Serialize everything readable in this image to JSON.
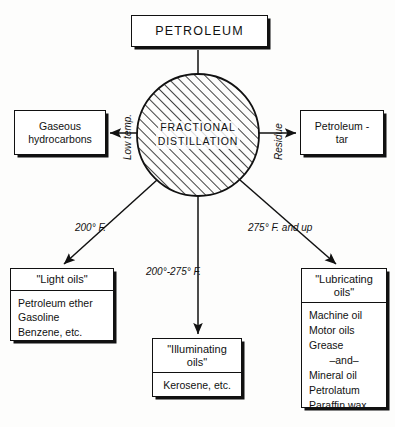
{
  "diagram": {
    "colors": {
      "ink": "#111111",
      "paper": "#fdfdfc",
      "hatch": "#111111"
    },
    "source_node": {
      "label": "PETROLEUM"
    },
    "process_node": {
      "line1": "FRACTIONAL",
      "line2": "DISTILLATION",
      "shape": "hatched-circle"
    },
    "edges": {
      "left": {
        "label": "Low temp.",
        "direction": "left"
      },
      "right": {
        "label": "Residue",
        "direction": "right"
      },
      "down_left": {
        "label": "200° F.",
        "direction": "down-left"
      },
      "down_center": {
        "label": "200°-275° F.",
        "direction": "down"
      },
      "down_right": {
        "label": "275° F. and up",
        "direction": "down-right"
      },
      "top": {
        "label": "",
        "direction": "down"
      }
    },
    "products": {
      "gaseous": {
        "line1": "Gaseous",
        "line2": "hydrocarbons"
      },
      "tar": {
        "line1": "Petroleum -",
        "line2": "tar"
      },
      "light_oils": {
        "caption": "\"Light oils\"",
        "items": [
          "Petroleum ether",
          "Gasoline",
          "Benzene, etc."
        ]
      },
      "illuminating_oils": {
        "caption_line1": "\"Illuminating",
        "caption_line2": "oils\"",
        "items": [
          "Kerosene, etc."
        ]
      },
      "lubricating_oils": {
        "caption_line1": "\"Lubricating",
        "caption_line2": "oils\"",
        "items": [
          "Machine oil",
          "Motor oils",
          "Grease",
          "–and–",
          "Mineral oil",
          "Petrolatum",
          "Paraffin wax"
        ]
      }
    }
  }
}
